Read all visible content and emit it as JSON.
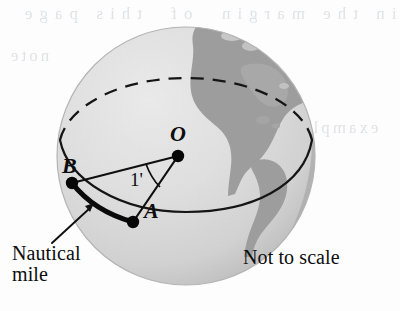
{
  "figure": {
    "labels": {
      "center_point": "O",
      "point_b": "B",
      "point_a": "A",
      "angle": "1'",
      "callout": "Nautical\nmile",
      "scale_note": "Not to scale"
    },
    "colors": {
      "globe_light": "#e2e2e2",
      "globe_mid": "#d4d4d4",
      "globe_shadow": "#bdbdbd",
      "landmass": "#9a9a9a",
      "stroke": "#111111",
      "page_background": "#fdfdfd"
    },
    "geometry": {
      "globe_center_x": 186,
      "globe_center_y": 156,
      "globe_radius": 129,
      "point_o": [
        178,
        156
      ],
      "point_b": [
        72,
        183
      ],
      "point_a": [
        133,
        222
      ]
    },
    "bleed_text": {
      "top": "in the margin  of  this page",
      "left": "note",
      "right": "example"
    }
  }
}
